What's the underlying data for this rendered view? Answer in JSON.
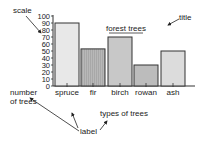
{
  "chart_data": {
    "type": "bar",
    "title": "forest trees",
    "xlabel": "types of trees",
    "ylabel": "number of trees",
    "categories": [
      "spruce",
      "fir",
      "birch",
      "rowan",
      "ash"
    ],
    "values": [
      90,
      53,
      70,
      30,
      50
    ],
    "ylim": [
      0,
      100
    ],
    "yticks": [
      "100",
      "90",
      "80",
      "70",
      "60",
      "50",
      "40",
      "30",
      "20",
      "10",
      "0"
    ],
    "grid": false,
    "legend": null,
    "bar_colors": [
      "#e8e8e8",
      "#b4b4b4",
      "#c8c8c8",
      "#bcbcbc",
      "#dcdcdc"
    ],
    "annotations": {
      "scale": "scale",
      "title": "title",
      "label": "label"
    }
  }
}
